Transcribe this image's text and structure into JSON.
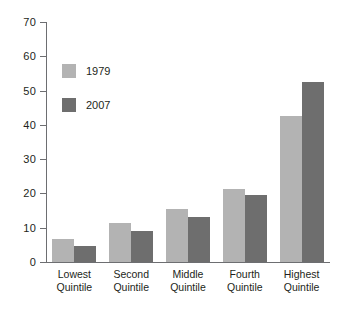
{
  "chart_data": {
    "type": "bar",
    "title": "",
    "xlabel": "",
    "ylabel": "",
    "ylim": [
      0,
      70
    ],
    "yticks": [
      0,
      10,
      20,
      30,
      40,
      50,
      60,
      70
    ],
    "grid": false,
    "legend_position": "upper-left-inside",
    "categories": [
      "Lowest Quintile",
      "Second Quintile",
      "Middle Quintile",
      "Fourth Quintile",
      "Highest Quintile"
    ],
    "category_lines": [
      [
        "Lowest",
        "Quintile"
      ],
      [
        "Second",
        "Quintile"
      ],
      [
        "Middle",
        "Quintile"
      ],
      [
        "Fourth",
        "Quintile"
      ],
      [
        "Highest",
        "Quintile"
      ]
    ],
    "series": [
      {
        "name": "1979",
        "color": "#b3b3b3",
        "values": [
          6.8,
          11.5,
          15.5,
          21.2,
          42.5
        ]
      },
      {
        "name": "2007",
        "color": "#6e6e6e",
        "values": [
          4.7,
          9.0,
          13.2,
          19.5,
          52.5
        ]
      }
    ]
  },
  "legend": {
    "items": [
      {
        "label": "1979",
        "color": "#b3b3b3"
      },
      {
        "label": "2007",
        "color": "#6e6e6e"
      }
    ]
  },
  "axis": {
    "y_tick_labels": [
      "70",
      "60",
      "50",
      "40",
      "30",
      "20",
      "10",
      "0"
    ]
  },
  "caption": {
    "partial_text": ""
  }
}
